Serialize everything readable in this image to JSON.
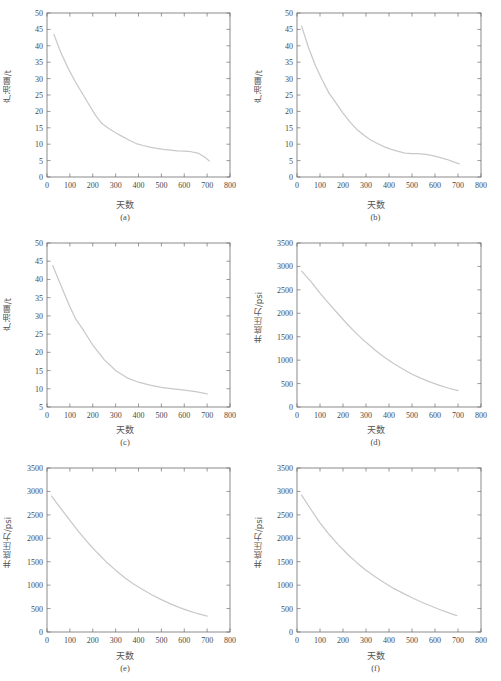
{
  "figure": {
    "layout": "3 rows x 2 columns",
    "panel_count": 6
  },
  "labels": {
    "x_axis_cn": "天数",
    "y_axis_oil_cn": "产油量/t",
    "y_axis_pressure_cn": "井底压力/psi",
    "caption_a": "(a)",
    "caption_b": "(b)",
    "caption_c": "(c)",
    "caption_d": "(d)",
    "caption_e": "(e)",
    "caption_f": "(f)"
  },
  "colors": {
    "axis": "#6e6e6e",
    "curve": "#c9c9c9",
    "text": "#4a4a4a",
    "background": "#ffffff"
  },
  "chart_data": [
    {
      "id": "a",
      "type": "line",
      "title": "(a)",
      "xlabel": "天数",
      "ylabel": "产油量/t",
      "xlim": [
        0,
        800
      ],
      "ylim": [
        0,
        50
      ],
      "xticks": [
        0,
        100,
        200,
        300,
        400,
        500,
        600,
        700,
        800
      ],
      "yticks": [
        0,
        5,
        10,
        15,
        20,
        25,
        30,
        35,
        40,
        45,
        50
      ],
      "grid": false,
      "legend": "none",
      "series": [
        {
          "name": "产油量",
          "x": [
            30,
            60,
            90,
            120,
            150,
            180,
            210,
            240,
            270,
            300,
            330,
            360,
            390,
            420,
            450,
            480,
            510,
            540,
            570,
            600,
            630,
            660,
            690,
            710
          ],
          "y": [
            43.5,
            38.0,
            33.5,
            29.5,
            26.0,
            22.5,
            19.0,
            16.3,
            14.8,
            13.5,
            12.3,
            11.2,
            10.2,
            9.6,
            9.1,
            8.7,
            8.4,
            8.2,
            8.0,
            7.9,
            7.7,
            7.3,
            6.0,
            4.9
          ]
        }
      ]
    },
    {
      "id": "b",
      "type": "line",
      "title": "(b)",
      "xlabel": "天数",
      "ylabel": "产油量/t",
      "xlim": [
        0,
        800
      ],
      "ylim": [
        0,
        50
      ],
      "xticks": [
        0,
        100,
        200,
        300,
        400,
        500,
        600,
        700,
        800
      ],
      "yticks": [
        0,
        5,
        10,
        15,
        20,
        25,
        30,
        35,
        40,
        45,
        50
      ],
      "grid": false,
      "legend": "none",
      "series": [
        {
          "name": "产油量",
          "x": [
            20,
            50,
            80,
            110,
            140,
            170,
            200,
            230,
            260,
            290,
            320,
            350,
            380,
            410,
            440,
            470,
            500,
            530,
            560,
            590,
            620,
            650,
            680,
            705
          ],
          "y": [
            46.0,
            39.5,
            34.0,
            29.5,
            25.5,
            22.5,
            19.5,
            16.8,
            14.5,
            12.8,
            11.3,
            10.2,
            9.2,
            8.4,
            7.8,
            7.3,
            7.1,
            7.1,
            6.9,
            6.5,
            6.0,
            5.4,
            4.6,
            4.0
          ]
        }
      ]
    },
    {
      "id": "c",
      "type": "line",
      "title": "(c)",
      "xlabel": "天数",
      "ylabel": "产油量/t",
      "xlim": [
        0,
        800
      ],
      "ylim": [
        5,
        50
      ],
      "xticks": [
        0,
        100,
        200,
        300,
        400,
        500,
        600,
        700,
        800
      ],
      "yticks": [
        5,
        10,
        15,
        20,
        25,
        30,
        35,
        40,
        45,
        50
      ],
      "grid": false,
      "legend": "none",
      "series": [
        {
          "name": "产油量",
          "x": [
            25,
            50,
            75,
            100,
            125,
            160,
            200,
            250,
            300,
            350,
            400,
            450,
            500,
            550,
            600,
            650,
            700
          ],
          "y": [
            43.8,
            40.0,
            36.2,
            32.5,
            29.2,
            26.0,
            22.0,
            18.0,
            15.0,
            13.0,
            11.8,
            11.0,
            10.4,
            10.0,
            9.6,
            9.2,
            8.6
          ]
        }
      ]
    },
    {
      "id": "d",
      "type": "line",
      "title": "(d)",
      "xlabel": "天数",
      "ylabel": "井底压力/psi",
      "xlim": [
        0,
        800
      ],
      "ylim": [
        0,
        3500
      ],
      "xticks": [
        0,
        100,
        200,
        300,
        400,
        500,
        600,
        700,
        800
      ],
      "yticks": [
        0,
        500,
        1000,
        1500,
        2000,
        2500,
        3000,
        3500
      ],
      "grid": false,
      "legend": "none",
      "series": [
        {
          "name": "井底压力",
          "x": [
            20,
            60,
            100,
            140,
            180,
            220,
            260,
            300,
            340,
            380,
            420,
            460,
            500,
            540,
            580,
            620,
            660,
            700
          ],
          "y": [
            2900,
            2680,
            2430,
            2200,
            1980,
            1760,
            1560,
            1380,
            1210,
            1060,
            930,
            810,
            700,
            610,
            530,
            460,
            400,
            350
          ]
        }
      ]
    },
    {
      "id": "e",
      "type": "line",
      "title": "(e)",
      "xlabel": "天数",
      "ylabel": "井底压力/psi",
      "xlim": [
        0,
        800
      ],
      "ylim": [
        0,
        3500
      ],
      "xticks": [
        0,
        100,
        200,
        300,
        400,
        500,
        600,
        700,
        800
      ],
      "yticks": [
        0,
        500,
        1000,
        1500,
        2000,
        2500,
        3000,
        3500
      ],
      "grid": false,
      "legend": "none",
      "series": [
        {
          "name": "井底压力",
          "x": [
            20,
            60,
            100,
            140,
            180,
            220,
            260,
            300,
            340,
            380,
            420,
            460,
            500,
            540,
            580,
            620,
            660,
            700
          ],
          "y": [
            2900,
            2640,
            2380,
            2130,
            1900,
            1690,
            1490,
            1320,
            1160,
            1020,
            900,
            790,
            690,
            600,
            520,
            450,
            390,
            340
          ]
        }
      ]
    },
    {
      "id": "f",
      "type": "line",
      "title": "(f)",
      "xlabel": "天数",
      "ylabel": "井底压力/psi",
      "xlim": [
        0,
        800
      ],
      "ylim": [
        0,
        3500
      ],
      "xticks": [
        0,
        100,
        200,
        300,
        400,
        500,
        600,
        700,
        800
      ],
      "yticks": [
        0,
        500,
        1000,
        1500,
        2000,
        2500,
        3000,
        3500
      ],
      "grid": false,
      "legend": "none",
      "series": [
        {
          "name": "井底压力",
          "x": [
            20,
            60,
            100,
            140,
            180,
            220,
            260,
            300,
            340,
            380,
            420,
            460,
            500,
            540,
            580,
            620,
            660,
            695
          ],
          "y": [
            2920,
            2620,
            2330,
            2080,
            1860,
            1660,
            1480,
            1320,
            1180,
            1050,
            930,
            830,
            730,
            640,
            560,
            480,
            410,
            350
          ]
        }
      ]
    }
  ]
}
